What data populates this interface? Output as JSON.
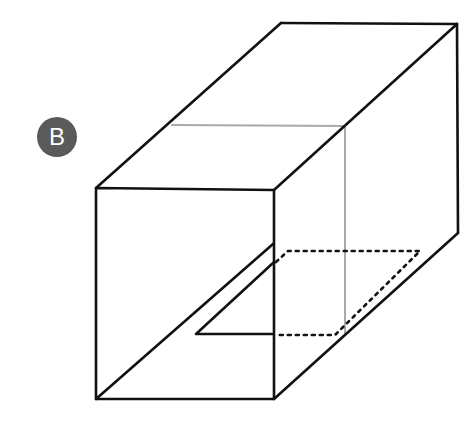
{
  "figure": {
    "label": "B",
    "colors": {
      "edge": "#111111",
      "hidden_edge": "#aaaaaa",
      "badge_bg": "#5a5a5a",
      "badge_text": "#ffffff"
    }
  }
}
